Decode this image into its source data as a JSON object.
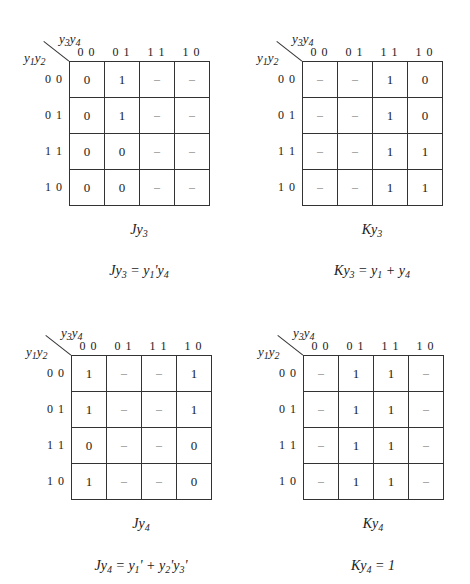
{
  "axis_labels": {
    "top": "y3y4",
    "left": "y1y2",
    "columns": [
      "0 0",
      "0 1",
      "1 1",
      "1 0"
    ],
    "rows": [
      "0 0",
      "0 1",
      "1 1",
      "1 0"
    ]
  },
  "kmaps": [
    {
      "id": "Jy3",
      "caption": "Jy3",
      "equation": "Jy3 = y1'y4",
      "cells": [
        [
          "0",
          "1",
          "–",
          "–"
        ],
        [
          "0",
          "1",
          "–",
          "–"
        ],
        [
          "0",
          "0",
          "–",
          "–"
        ],
        [
          "0",
          "0",
          "–",
          "–"
        ]
      ]
    },
    {
      "id": "Ky3",
      "caption": "Ky3",
      "equation": "Ky3 = y1 + y4",
      "cells": [
        [
          "–",
          "–",
          "1",
          "0"
        ],
        [
          "–",
          "–",
          "1",
          "0"
        ],
        [
          "–",
          "–",
          "1",
          "1"
        ],
        [
          "–",
          "–",
          "1",
          "1"
        ]
      ]
    },
    {
      "id": "Jy4",
      "caption": "Jy4",
      "equation": "Jy4 = y1' + y2'y3'",
      "cells": [
        [
          "1",
          "–",
          "–",
          "1"
        ],
        [
          "1",
          "–",
          "–",
          "1"
        ],
        [
          "0",
          "–",
          "–",
          "0"
        ],
        [
          "1",
          "–",
          "–",
          "0"
        ]
      ]
    },
    {
      "id": "Ky4",
      "caption": "Ky4",
      "equation": "Ky4 = 1",
      "cells": [
        [
          "–",
          "1",
          "1",
          "–"
        ],
        [
          "–",
          "1",
          "1",
          "–"
        ],
        [
          "–",
          "1",
          "1",
          "–"
        ],
        [
          "–",
          "1",
          "1",
          "–"
        ]
      ]
    }
  ]
}
